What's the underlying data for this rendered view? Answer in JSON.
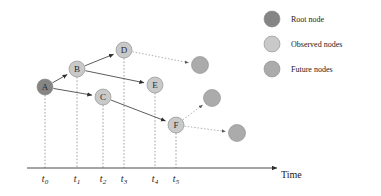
{
  "figure": {
    "kind": "temporal-dag-diagram",
    "background": "#ffffff"
  },
  "colors": {
    "root_node": "#858585",
    "observed_node": "#c9c9c9",
    "future_node": "#ababab",
    "node_stroke": "#8a8a8a",
    "edge": "#4a4a4a",
    "dotted_edge": "#8f8f8f",
    "dropline": "#7a7a7a",
    "axis": "#4a4a4a",
    "text": "#1a1a1a"
  },
  "axis": {
    "title": "Time",
    "title_x": 281,
    "title_y": 178,
    "line_y": 168,
    "line_x_start": 27,
    "line_x_end": 277,
    "ticks": [
      {
        "id": "t0",
        "label": "t",
        "sub": "0",
        "x": 45
      },
      {
        "id": "t1",
        "label": "t",
        "sub": "1",
        "x": 77
      },
      {
        "id": "t2",
        "label": "t",
        "sub": "2",
        "x": 103
      },
      {
        "id": "t3",
        "label": "t",
        "sub": "3",
        "x": 124
      },
      {
        "id": "t4",
        "label": "t",
        "sub": "4",
        "x": 155
      },
      {
        "id": "t5",
        "label": "t",
        "sub": "5",
        "x": 176
      }
    ],
    "tick_label_y": 182
  },
  "nodes": [
    {
      "id": "A",
      "label": "A",
      "x": 45,
      "y": 87,
      "r": 8,
      "type": "root",
      "dropline": true
    },
    {
      "id": "B",
      "label": "B",
      "x": 77,
      "y": 69,
      "r": 8,
      "type": "observed",
      "dropline": true
    },
    {
      "id": "C",
      "label": "C",
      "x": 103,
      "y": 97,
      "r": 8,
      "type": "observed",
      "dropline": true
    },
    {
      "id": "D",
      "label": "D",
      "x": 124,
      "y": 50,
      "r": 8,
      "type": "observed",
      "dropline": true
    },
    {
      "id": "E",
      "label": "E",
      "x": 155,
      "y": 85,
      "r": 8,
      "type": "observed",
      "dropline": true
    },
    {
      "id": "F",
      "label": "F",
      "x": 176,
      "y": 125,
      "r": 8,
      "type": "observed",
      "dropline": true
    },
    {
      "id": "FUT1",
      "label": "",
      "x": 200,
      "y": 65,
      "r": 8.5,
      "type": "future",
      "dropline": false
    },
    {
      "id": "FUT2",
      "label": "",
      "x": 212,
      "y": 98,
      "r": 8.5,
      "type": "future",
      "dropline": false
    },
    {
      "id": "FUT3",
      "label": "",
      "x": 237,
      "y": 133,
      "r": 8.5,
      "type": "future",
      "dropline": false
    }
  ],
  "edges": [
    {
      "from": "A",
      "to": "B",
      "style": "solid"
    },
    {
      "from": "A",
      "to": "C",
      "style": "solid"
    },
    {
      "from": "B",
      "to": "D",
      "style": "solid"
    },
    {
      "from": "B",
      "to": "E",
      "style": "solid"
    },
    {
      "from": "C",
      "to": "F",
      "style": "solid"
    },
    {
      "from": "D",
      "to": "FUT1",
      "style": "dotted"
    },
    {
      "from": "F",
      "to": "FUT2",
      "style": "dotted"
    },
    {
      "from": "F",
      "to": "FUT3",
      "style": "dotted"
    }
  ],
  "legend": {
    "marker_x": 272,
    "label_x": 291,
    "items": [
      {
        "id": "root",
        "label": "Root node",
        "y": 19,
        "color": "#858585",
        "r": 8
      },
      {
        "id": "observed",
        "label": "Observed nodes",
        "y": 44,
        "color": "#c9c9c9",
        "r": 8
      },
      {
        "id": "future",
        "label": "Future nodes",
        "y": 69,
        "color": "#ababab",
        "r": 8
      }
    ]
  }
}
